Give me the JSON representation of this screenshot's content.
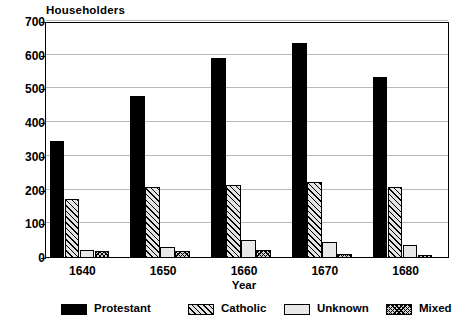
{
  "chart_data": {
    "type": "bar",
    "title": "",
    "ylabel": "Householders",
    "xlabel": "Year",
    "categories": [
      "1640",
      "1650",
      "1660",
      "1670",
      "1680"
    ],
    "ylim": [
      0,
      700
    ],
    "yticks": [
      0,
      100,
      200,
      300,
      400,
      500,
      600,
      700
    ],
    "ytick_labels": [
      "0",
      "100",
      "200",
      "300",
      "400",
      "500",
      "600",
      "700"
    ],
    "grid": true,
    "legend_position": "bottom",
    "series": [
      {
        "name": "Protestant",
        "pattern": "solid-black",
        "values": [
          348,
          480,
          593,
          638,
          537
        ]
      },
      {
        "name": "Catholic",
        "pattern": "diagonal-hatch",
        "values": [
          175,
          212,
          218,
          225,
          212
        ]
      },
      {
        "name": "Unknown",
        "pattern": "light-fill",
        "values": [
          25,
          32,
          52,
          48,
          38
        ]
      },
      {
        "name": "Mixed",
        "pattern": "cross-hatch",
        "values": [
          20,
          20,
          25,
          12,
          10
        ]
      }
    ]
  },
  "legend": {
    "items": [
      {
        "label": "Protestant"
      },
      {
        "label": "Catholic"
      },
      {
        "label": "Unknown"
      },
      {
        "label": "Mixed"
      }
    ]
  },
  "colors": {
    "background": "#ffffff",
    "axis": "#000000",
    "gridline": "#b9b9b9",
    "protestant": "#000000",
    "catholic_fill": "#e3e3e3",
    "unknown_fill": "#e8e8e8",
    "mixed_fill": "#d0d0d0"
  }
}
